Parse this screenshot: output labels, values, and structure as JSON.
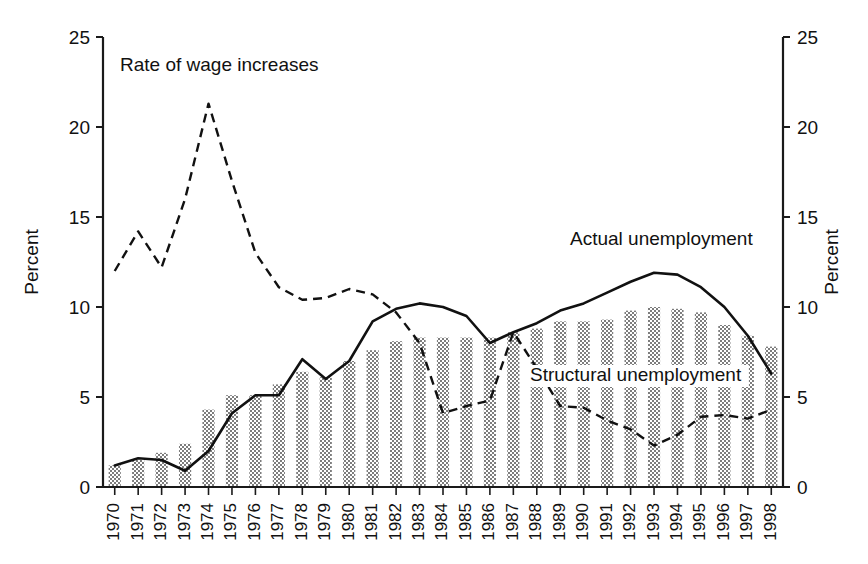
{
  "chart_data": {
    "type": "bar",
    "title": "",
    "xlabel": "",
    "ylabel": "Percent",
    "ylabel_right": "Percent",
    "ylim": [
      0,
      25
    ],
    "yticks": [
      0,
      5,
      10,
      15,
      20,
      25
    ],
    "grid": false,
    "legend_position": "inline-annotations",
    "categories": [
      "1970",
      "1971",
      "1972",
      "1973",
      "1974",
      "1975",
      "1976",
      "1977",
      "1978",
      "1979",
      "1980",
      "1981",
      "1982",
      "1983",
      "1984",
      "1985",
      "1986",
      "1987",
      "1988",
      "1989",
      "1990",
      "1991",
      "1992",
      "1993",
      "1994",
      "1995",
      "1996",
      "1997",
      "1998"
    ],
    "series": [
      {
        "name": "Structural unemployment",
        "render": "bar",
        "values": [
          1.2,
          1.5,
          1.9,
          2.4,
          4.3,
          5.1,
          5.1,
          5.7,
          6.4,
          6.1,
          7.0,
          7.6,
          8.1,
          8.3,
          8.3,
          8.3,
          8.3,
          8.6,
          8.8,
          9.2,
          9.2,
          9.3,
          9.8,
          10.0,
          9.9,
          9.7,
          9.0,
          8.4,
          7.8
        ]
      },
      {
        "name": "Actual unemployment",
        "render": "line-solid",
        "values": [
          1.2,
          1.6,
          1.5,
          0.9,
          2.0,
          4.1,
          5.1,
          5.1,
          7.1,
          6.0,
          7.0,
          9.2,
          9.9,
          10.2,
          10.0,
          9.5,
          8.0,
          8.6,
          9.1,
          9.8,
          10.2,
          10.8,
          11.4,
          11.9,
          11.8,
          11.1,
          10.0,
          8.4,
          6.3
        ]
      },
      {
        "name": "Rate of wage increases",
        "render": "line-dashed",
        "values": [
          12.0,
          14.2,
          12.2,
          16.0,
          21.3,
          17.0,
          13.0,
          11.1,
          10.4,
          10.5,
          11.0,
          10.7,
          9.7,
          8.0,
          4.1,
          4.5,
          4.8,
          8.6,
          6.6,
          4.5,
          4.4,
          3.7,
          3.2,
          2.3,
          2.9,
          3.9,
          4.0,
          3.8,
          4.3
        ]
      }
    ],
    "annotations": [
      {
        "name": "wage-label",
        "text": "Rate of wage increases"
      },
      {
        "name": "actual-label",
        "text": "Actual unemployment"
      },
      {
        "name": "structural-label",
        "text": "Structural unemployment"
      }
    ],
    "colors": {
      "bar_fill": "#8a8a8a",
      "line": "#111111",
      "axis": "#1a1a1a",
      "background": "#ffffff"
    }
  }
}
